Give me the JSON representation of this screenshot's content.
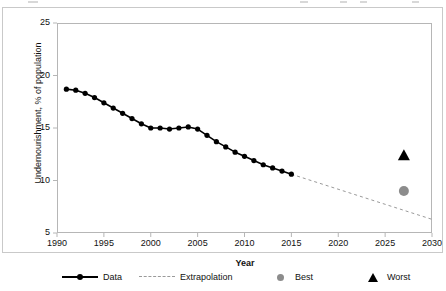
{
  "chart_data": {
    "type": "line",
    "title": "",
    "xlabel": "Year",
    "ylabel": "Undernourishment, % of population",
    "xlim": [
      1990,
      2030
    ],
    "ylim": [
      5,
      25
    ],
    "xticks": [
      1990,
      1995,
      2000,
      2005,
      2010,
      2015,
      2020,
      2025,
      2030
    ],
    "yticks": [
      5,
      10,
      15,
      20,
      25
    ],
    "grid": false,
    "legend_position": "bottom",
    "legend": [
      "Data",
      "Extrapolation",
      "Best",
      "Worst"
    ],
    "series": [
      {
        "name": "Data",
        "style": "solid-line-with-markers",
        "color": "#000000",
        "x": [
          1991,
          1992,
          1993,
          1994,
          1995,
          1996,
          1997,
          1998,
          1999,
          2000,
          2001,
          2002,
          2003,
          2004,
          2005,
          2006,
          2007,
          2008,
          2009,
          2010,
          2011,
          2012,
          2013,
          2014,
          2015
        ],
        "values": [
          18.7,
          18.6,
          18.3,
          17.9,
          17.4,
          16.9,
          16.4,
          15.9,
          15.4,
          15.0,
          15.0,
          14.9,
          15.0,
          15.1,
          14.9,
          14.3,
          13.7,
          13.2,
          12.7,
          12.3,
          11.9,
          11.5,
          11.2,
          10.9,
          10.6
        ]
      },
      {
        "name": "Extrapolation",
        "style": "dashed-line",
        "color": "#9a9a9a",
        "x": [
          2015,
          2030
        ],
        "values": [
          10.6,
          6.3
        ]
      },
      {
        "name": "Best",
        "style": "circle-marker",
        "color": "#8c8c8c",
        "x": [
          2027
        ],
        "values": [
          9.0
        ]
      },
      {
        "name": "Worst",
        "style": "triangle-marker",
        "color": "#000000",
        "x": [
          2027
        ],
        "values": [
          12.4
        ]
      }
    ]
  },
  "axes": {
    "y_title": "Undernourishment, % of population",
    "x_title": "Year",
    "y_tick_labels": [
      "25",
      "20",
      "15",
      "10",
      "5"
    ],
    "x_tick_labels": [
      "1990",
      "1995",
      "2000",
      "2005",
      "2010",
      "2015",
      "2020",
      "2025",
      "2030"
    ]
  },
  "legend": {
    "items": [
      {
        "label": "Data",
        "swatch": "solid-line-marker-swatch"
      },
      {
        "label": "Extrapolation",
        "swatch": "dashed-line-swatch"
      },
      {
        "label": "Best",
        "swatch": "gray-circle-swatch"
      },
      {
        "label": "Worst",
        "swatch": "black-triangle-swatch"
      }
    ]
  },
  "colors": {
    "data_line": "#000000",
    "extrapolation_line": "#9a9a9a",
    "best_marker": "#8c8c8c",
    "worst_marker": "#000000",
    "frame": "#b6b6b6",
    "figure_border": "#c9c9c9"
  }
}
